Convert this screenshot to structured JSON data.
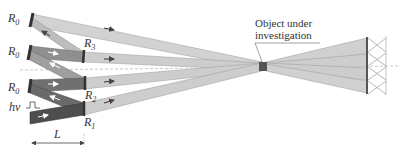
{
  "diagram": {
    "type": "optical-setup",
    "labels": {
      "mirror_r0_top": "R",
      "mirror_r0_mid": "R",
      "mirror_r0_bot": "R",
      "r0_sub": "0",
      "r3": "R",
      "r3_sub": "3",
      "r2": "R",
      "r2_sub": "2",
      "r1": "R",
      "r1_sub": "1",
      "input_pulse": "hν",
      "distance": "L",
      "object_line1": "Object under",
      "object_line2": "investigation"
    },
    "colors": {
      "beam_light": "#cfcfcf",
      "beam_medium": "#9a9a9a",
      "beam_dark": "#5a5a5a",
      "mirror": "#3a3a3a",
      "detector_hatch": "#9a9a9a",
      "axis_dash": "#bbbbbb",
      "text": "#333333"
    }
  }
}
